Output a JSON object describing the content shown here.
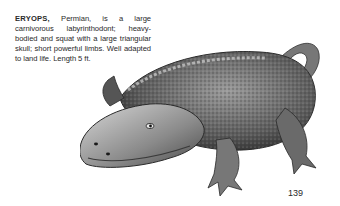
{
  "caption": {
    "species_name": "ERYOPS,",
    "text": " Permian, is a large carnivorous labyrinthodont; heavy-bodied and squat with a large triangular skull; short powerful limbs. Well adapted to land life. Length 5 ft."
  },
  "illustration": {
    "subject": "Eryops",
    "style": "grayscale stippled drawing",
    "colors": {
      "dark": "#3a3a3a",
      "mid": "#7a7a7a",
      "light": "#c8c8c8"
    }
  },
  "page": {
    "number": "139"
  }
}
